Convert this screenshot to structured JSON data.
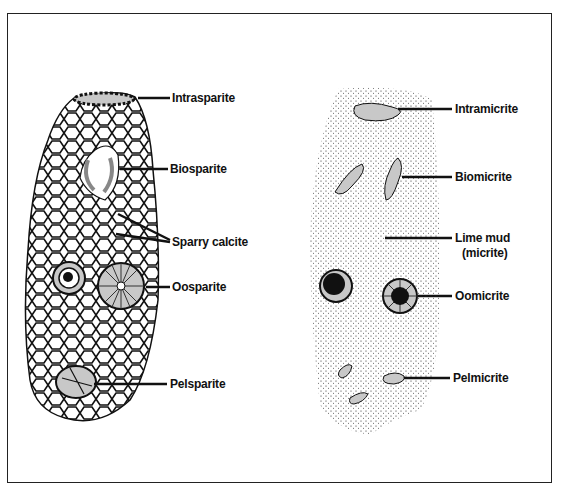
{
  "diagram": {
    "left_panel": {
      "title": "Sparite-cemented limestones",
      "labels": [
        {
          "id": "intrasparite",
          "text": "Intrasparite",
          "x": 172,
          "y": 92
        },
        {
          "id": "biosparite",
          "text": "Biosparite",
          "x": 170,
          "y": 163
        },
        {
          "id": "sparry-calcite",
          "text": "Sparry calcite",
          "x": 172,
          "y": 235
        },
        {
          "id": "oosparite",
          "text": "Oosparite",
          "x": 172,
          "y": 280
        },
        {
          "id": "pelsparite",
          "text": "Pelsparite",
          "x": 170,
          "y": 377
        }
      ]
    },
    "right_panel": {
      "labels": [
        {
          "id": "intramicrite",
          "text": "Intramicrite",
          "x": 455,
          "y": 103
        },
        {
          "id": "biomicrite",
          "text": "Biomicrite",
          "x": 455,
          "y": 170
        },
        {
          "id": "lime-mud",
          "text": "Lime mud",
          "x": 455,
          "y": 232
        },
        {
          "id": "lime-mud-sub",
          "text": "(micrite)",
          "x": 462,
          "y": 246
        },
        {
          "id": "oomicrite",
          "text": "Oomicrite",
          "x": 455,
          "y": 290
        },
        {
          "id": "pelmicrite",
          "text": "Pelmicrite",
          "x": 453,
          "y": 372
        }
      ]
    },
    "colors": {
      "grain": "#c8c8c8",
      "ink": "#111111",
      "background": "#ffffff"
    }
  }
}
